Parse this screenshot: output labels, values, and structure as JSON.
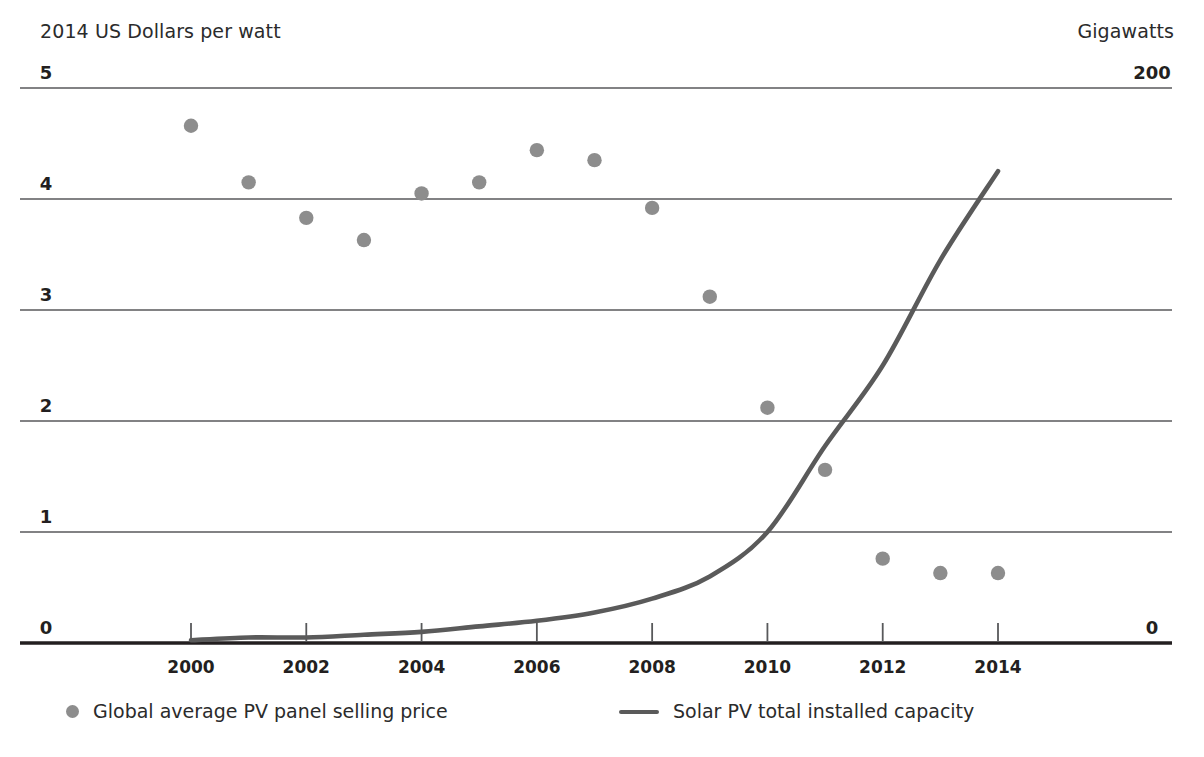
{
  "header": {
    "left_axis_title": "2014 US Dollars per watt",
    "right_axis_title": "Gigawatts"
  },
  "legend": {
    "items": [
      {
        "label": "Global average PV panel selling price",
        "marker": "dot",
        "color": "#8d8d8d"
      },
      {
        "label": "Solar PV total installed capacity",
        "marker": "line",
        "color": "#5a5a5a"
      }
    ]
  },
  "chart_data": {
    "type": "scatter",
    "title": "",
    "xlabel": "",
    "ylabel": "2014 US Dollars per watt",
    "y2label": "Gigawatts",
    "xlim": [
      1999.5,
      2014.9
    ],
    "ylim": [
      0,
      5
    ],
    "y2lim": [
      0,
      200
    ],
    "grid": true,
    "legend_position": "bottom",
    "x_ticks": [
      "2000",
      "2002",
      "2004",
      "2006",
      "2008",
      "2010",
      "2012",
      "2014"
    ],
    "x_tick_values": [
      2000,
      2002,
      2004,
      2006,
      2008,
      2010,
      2012,
      2014
    ],
    "y_ticks": [
      "0",
      "1",
      "2",
      "3",
      "4",
      "5"
    ],
    "y_tick_values": [
      0,
      1,
      2,
      3,
      4,
      5
    ],
    "y2_ticks": [
      "0",
      "200"
    ],
    "y2_tick_values": [
      0,
      200
    ],
    "series": [
      {
        "name": "Global average PV panel selling price",
        "type": "scatter",
        "axis": "left",
        "units": "2014 US Dollars per watt",
        "color": "#8d8d8d",
        "x": [
          2000,
          2001,
          2002,
          2003,
          2004,
          2005,
          2006,
          2007,
          2008,
          2009,
          2010,
          2011,
          2012,
          2013,
          2014
        ],
        "values": [
          4.66,
          4.15,
          3.83,
          3.63,
          4.05,
          4.15,
          4.44,
          4.35,
          3.92,
          3.12,
          2.12,
          1.56,
          0.76,
          0.63,
          0.63
        ]
      },
      {
        "name": "Solar PV total installed capacity",
        "type": "line",
        "axis": "right",
        "units": "Gigawatts",
        "color": "#5a5a5a",
        "x": [
          2000,
          2001,
          2002,
          2003,
          2004,
          2005,
          2006,
          2007,
          2008,
          2009,
          2010,
          2011,
          2012,
          2013,
          2014
        ],
        "values": [
          1,
          2,
          2,
          3,
          4,
          6,
          8,
          11,
          16,
          24,
          40,
          71,
          100,
          138,
          170
        ]
      }
    ]
  }
}
